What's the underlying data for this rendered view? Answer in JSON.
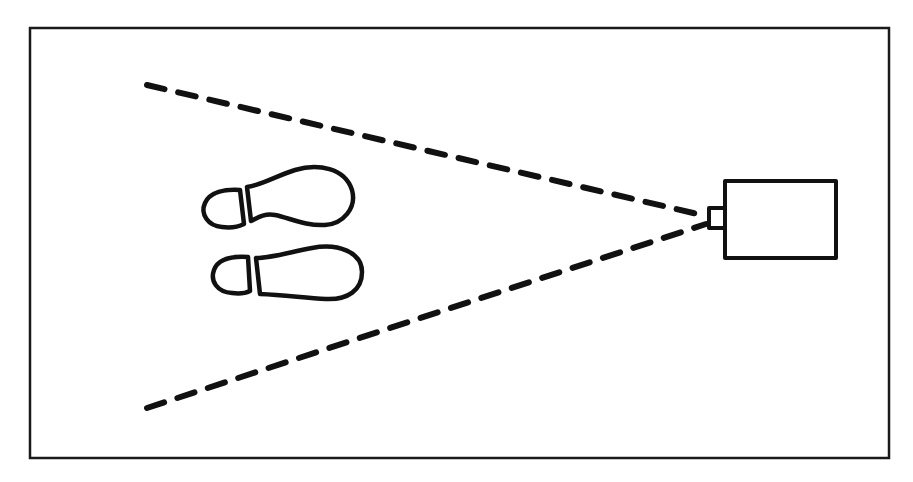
{
  "diagram": {
    "title": "",
    "canvas": {
      "width": 913,
      "height": 482,
      "background": "#ffffff"
    },
    "frame": {
      "x": 30,
      "y": 28,
      "width": 859,
      "height": 430,
      "stroke": "#1a1a1a"
    },
    "camera": {
      "body": {
        "x": 725,
        "y": 181,
        "width": 111,
        "height": 77
      },
      "lens": {
        "x": 709,
        "y": 208,
        "width": 16,
        "height": 20
      }
    },
    "field_of_view": {
      "apex": [
        706,
        219
      ],
      "upper_ray_end": [
        147,
        85
      ],
      "lower_ray_end": [
        147,
        408
      ],
      "style": "dashed"
    },
    "footprints": [
      {
        "name": "upper-footprint",
        "heel_center": [
          228,
          207
        ],
        "sole_span_x": [
          246,
          352
        ]
      },
      {
        "name": "lower-footprint",
        "heel_center": [
          236,
          273
        ],
        "sole_span_x": [
          255,
          362
        ]
      }
    ],
    "labels": []
  }
}
